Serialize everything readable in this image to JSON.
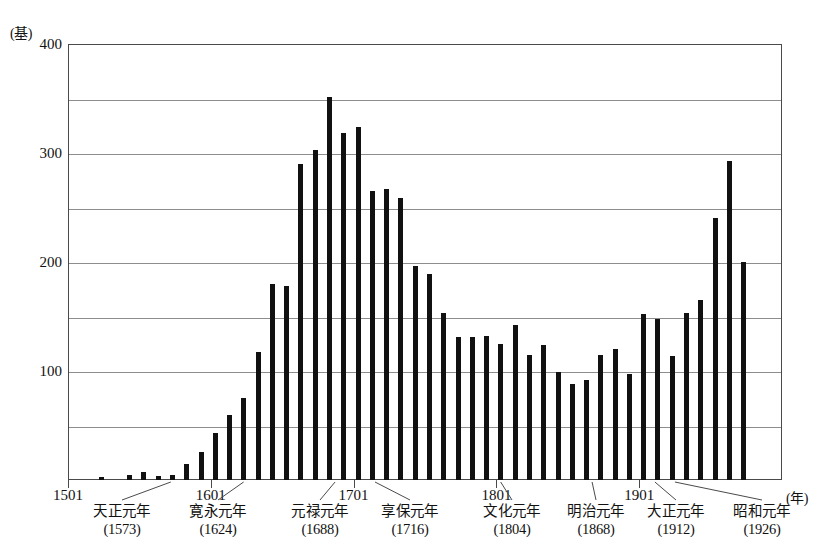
{
  "chart_data": {
    "type": "bar",
    "title": "",
    "xlabel": "(年)",
    "ylabel": "(基)",
    "ylim": [
      0,
      400
    ],
    "xlim": [
      1501,
      2001
    ],
    "grid": true,
    "legend": false,
    "y_ticks_major": [
      0,
      100,
      200,
      300,
      400
    ],
    "y_tick_labels": [
      "",
      "100",
      "200",
      "300",
      "400"
    ],
    "y_gridlines": [
      50,
      100,
      150,
      200,
      250,
      300,
      350,
      400
    ],
    "x_ticks": [
      1501,
      1601,
      1701,
      1801,
      1901
    ],
    "x_tick_labels": [
      "1501",
      "1601",
      "1701",
      "1801",
      "1901"
    ],
    "bar_interval_years": 10,
    "categories": [
      "1501",
      "1511",
      "1521",
      "1531",
      "1541",
      "1551",
      "1561",
      "1571",
      "1581",
      "1591",
      "1601",
      "1611",
      "1621",
      "1631",
      "1641",
      "1651",
      "1661",
      "1671",
      "1681",
      "1691",
      "1701",
      "1711",
      "1721",
      "1731",
      "1741",
      "1751",
      "1761",
      "1771",
      "1781",
      "1791",
      "1801",
      "1811",
      "1821",
      "1831",
      "1841",
      "1851",
      "1861",
      "1871",
      "1881",
      "1891",
      "1901",
      "1911",
      "1921",
      "1931",
      "1941",
      "1951",
      "1961",
      "1971",
      "1981",
      "1991"
    ],
    "values": [
      0,
      0,
      3,
      0,
      5,
      7,
      4,
      5,
      15,
      26,
      43,
      60,
      75,
      117,
      180,
      178,
      290,
      303,
      351,
      318,
      324,
      265,
      267,
      259,
      196,
      189,
      153,
      131,
      131,
      132,
      125,
      142,
      115,
      124,
      99,
      88,
      92,
      115,
      120,
      97,
      152,
      148,
      114,
      153,
      165,
      240,
      293,
      200,
      0,
      0
    ],
    "annotations": [
      {
        "name": "tensho",
        "era": "天正元年",
        "year": "(1573)",
        "target_year": 1573
      },
      {
        "name": "kanei",
        "era": "寛永元年",
        "year": "(1624)",
        "target_year": 1624
      },
      {
        "name": "genroku",
        "era": "元禄元年",
        "year": "(1688)",
        "target_year": 1688
      },
      {
        "name": "kyoho",
        "era": "享保元年",
        "year": "(1716)",
        "target_year": 1716
      },
      {
        "name": "bunka",
        "era": "文化元年",
        "year": "(1804)",
        "target_year": 1804
      },
      {
        "name": "meiji",
        "era": "明治元年",
        "year": "(1868)",
        "target_year": 1868
      },
      {
        "name": "taisho",
        "era": "大正元年",
        "year": "(1912)",
        "target_year": 1912
      },
      {
        "name": "showa",
        "era": "昭和元年",
        "year": "(1926)",
        "target_year": 1926
      }
    ],
    "colors": {
      "bar": "#111111",
      "grid": "#8d8d8d",
      "frame": "#4a4a4a",
      "text": "#111111",
      "background": "#ffffff"
    }
  },
  "caption": ""
}
